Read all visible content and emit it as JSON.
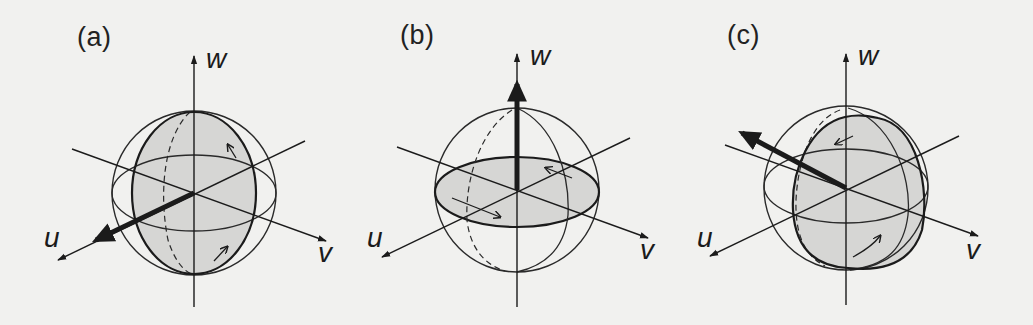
{
  "figure": {
    "background_color": "#f1f1ef",
    "ink_color": "#1b1b1b",
    "shade_color": "#d6d6d4",
    "panels": [
      {
        "label": "(a)",
        "axes": {
          "u": "u",
          "v": "v",
          "w": "w"
        },
        "rotation_axis": "u",
        "rotation_plane": "v-w (vertical great circle)"
      },
      {
        "label": "(b)",
        "axes": {
          "u": "u",
          "v": "v",
          "w": "w"
        },
        "rotation_axis": "w",
        "rotation_plane": "u-v (horizontal great circle)"
      },
      {
        "label": "(c)",
        "axes": {
          "u": "u",
          "v": "v",
          "w": "w"
        },
        "rotation_axis": "tilted, between -v and +w/u",
        "rotation_plane": "oblique great circle"
      }
    ]
  }
}
